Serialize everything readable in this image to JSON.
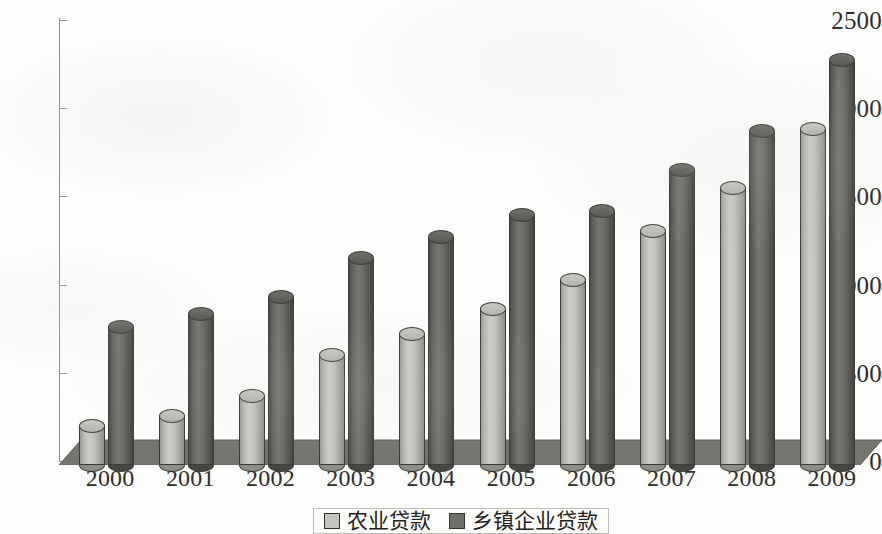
{
  "chart_data": {
    "type": "bar",
    "title": "",
    "subtitle": "",
    "xlabel": "",
    "ylabel": "",
    "categories": [
      "2000",
      "2001",
      "2002",
      "2003",
      "2004",
      "2005",
      "2006",
      "2007",
      "2008",
      "2009"
    ],
    "series": [
      {
        "name": "农业贷款",
        "color": "#c4c4bd",
        "values": [
          220,
          280,
          390,
          625,
          740,
          885,
          1050,
          1325,
          1570,
          1905
        ]
      },
      {
        "name": "乡镇企业贷款",
        "color": "#6e6e6a",
        "values": [
          780,
          855,
          950,
          1175,
          1290,
          1420,
          1440,
          1675,
          1895,
          2295
        ]
      }
    ],
    "ylim": [
      0,
      2500
    ],
    "y_ticks": [
      "0",
      "500",
      "1000",
      "1500",
      "2000",
      "2500"
    ],
    "y_tick_values": [
      0,
      500,
      1000,
      1500,
      2000,
      2500
    ],
    "grid": false,
    "legend_position": "bottom",
    "style": "3d-cylinder"
  },
  "colors": {
    "series_light": "#c4c4bd",
    "series_dark": "#6e6e6a",
    "floor": "#75756f",
    "axis": "#8d8d88",
    "text": "#2e2e2c"
  }
}
